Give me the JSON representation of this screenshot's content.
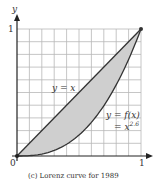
{
  "chart_data": {
    "type": "line",
    "title": "",
    "caption": "(c) Lorenz curve for 1989",
    "xlabel": "",
    "ylabel": "y",
    "xlim": [
      0,
      1
    ],
    "ylim": [
      0,
      1
    ],
    "grid": true,
    "grid_divisions": 10,
    "x_ticks": [
      "0",
      "1"
    ],
    "y_ticks": [
      "1"
    ],
    "series": [
      {
        "name": "y = x",
        "function": "x",
        "x": [
          0,
          0.5,
          1
        ],
        "y": [
          0,
          0.5,
          1
        ]
      },
      {
        "name": "y = f(x) = x^2.6",
        "function": "x^2.6",
        "x": [
          0,
          0.2,
          0.4,
          0.6,
          0.8,
          1
        ],
        "y": [
          0,
          0.015,
          0.092,
          0.265,
          0.56,
          1
        ]
      }
    ],
    "shaded_region": "between y = x and y = x^2.6",
    "annotations": [
      "y = x",
      "y = f(x)",
      "= x^2.6"
    ]
  },
  "labels": {
    "y_axis": "y",
    "origin": "0",
    "x_one": "1",
    "y_one": "1",
    "line_label": "y = x",
    "curve_label_1": "y = f(x)",
    "curve_label_2a": "= x",
    "curve_label_2b": "2.6",
    "caption": "(c) Lorenz curve for 1989"
  },
  "colors": {
    "grid": "#b8b8b8",
    "axis": "#222222",
    "shade": "#cfcfcf",
    "curve": "#333333"
  }
}
